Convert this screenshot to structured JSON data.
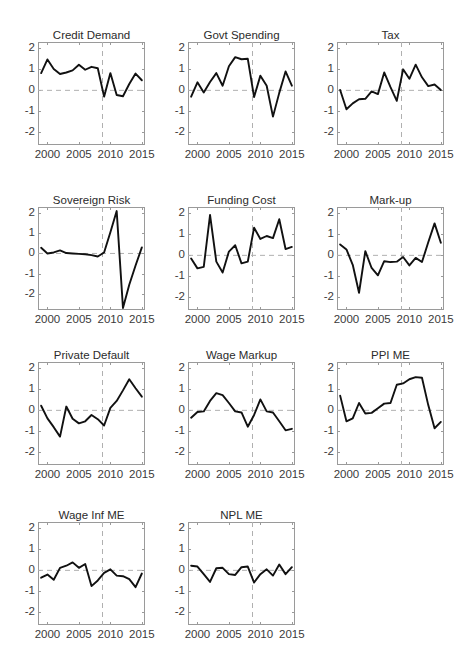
{
  "figure": {
    "panel_cols": 3,
    "panel_rows": 4,
    "axis_color": "#9a9a9a",
    "line_color": "#111111",
    "grid_color": "#b0b0b0"
  },
  "chart_data": [
    {
      "type": "line",
      "title": "Credit Demand",
      "xlabel": "",
      "ylabel": "",
      "xlim": [
        1998.5,
        2015.5
      ],
      "ylim": [
        -2.6,
        2.3
      ],
      "xticks": [
        2000,
        2005,
        2010,
        2015
      ],
      "yticks": [
        2,
        1,
        0,
        -1,
        -2
      ],
      "grid": false,
      "zero_line": true,
      "vline": 2008.75,
      "x": [
        1999,
        2000,
        2001,
        2002,
        2003,
        2004,
        2005,
        2006,
        2007,
        2008,
        2009,
        2010,
        2011,
        2012,
        2013,
        2014,
        2015
      ],
      "values": [
        0.82,
        1.47,
        1.02,
        0.78,
        0.85,
        0.95,
        1.22,
        0.98,
        1.12,
        1.05,
        -0.3,
        0.82,
        -0.22,
        -0.28,
        0.3,
        0.8,
        0.48
      ]
    },
    {
      "type": "line",
      "title": "Govt Spending",
      "xlabel": "",
      "ylabel": "",
      "xlim": [
        1998.5,
        2015.5
      ],
      "ylim": [
        -2.6,
        2.3
      ],
      "xticks": [
        2000,
        2005,
        2010,
        2015
      ],
      "yticks": [
        2,
        1,
        0,
        -1,
        -2
      ],
      "grid": false,
      "zero_line": true,
      "vline": 2008.75,
      "x": [
        1999,
        2000,
        2001,
        2002,
        2003,
        2004,
        2005,
        2006,
        2007,
        2008,
        2009,
        2010,
        2011,
        2012,
        2013,
        2014,
        2015
      ],
      "values": [
        -0.3,
        0.38,
        -0.1,
        0.4,
        0.82,
        0.22,
        1.15,
        1.58,
        1.48,
        1.5,
        -0.32,
        0.7,
        0.22,
        -1.25,
        -0.12,
        0.9,
        0.22
      ]
    },
    {
      "type": "line",
      "title": "Tax",
      "xlabel": "",
      "ylabel": "",
      "xlim": [
        1998.5,
        2015.5
      ],
      "ylim": [
        -2.6,
        2.3
      ],
      "xticks": [
        2000,
        2005,
        2010,
        2015
      ],
      "yticks": [
        2,
        1,
        0,
        -1,
        -2
      ],
      "grid": false,
      "zero_line": true,
      "vline": 2008.75,
      "x": [
        1999,
        2000,
        2001,
        2002,
        2003,
        2004,
        2005,
        2006,
        2007,
        2008,
        2009,
        2010,
        2011,
        2012,
        2013,
        2014,
        2015
      ],
      "values": [
        0.02,
        -0.9,
        -0.62,
        -0.42,
        -0.4,
        -0.05,
        -0.18,
        0.85,
        0.15,
        -0.5,
        1.0,
        0.55,
        1.22,
        0.62,
        0.2,
        0.28,
        0.02
      ]
    },
    {
      "type": "line",
      "title": "Sovereign Risk",
      "xlabel": "",
      "ylabel": "",
      "xlim": [
        1998.5,
        2015.5
      ],
      "ylim": [
        -2.8,
        2.3
      ],
      "xticks": [
        2000,
        2005,
        2010,
        2015
      ],
      "yticks": [
        2,
        1,
        0,
        -1,
        -2
      ],
      "grid": false,
      "zero_line": true,
      "vline": 2008.75,
      "x": [
        1999,
        2000,
        2001,
        2002,
        2003,
        2004,
        2005,
        2006,
        2007,
        2008,
        2009,
        2010,
        2011,
        2012,
        2013,
        2014,
        2015
      ],
      "values": [
        0.28,
        0.0,
        0.05,
        0.15,
        0.02,
        0.0,
        -0.02,
        -0.04,
        -0.08,
        -0.15,
        0.05,
        1.05,
        2.1,
        -2.7,
        -1.55,
        -0.6,
        0.3
      ]
    },
    {
      "type": "line",
      "title": "Funding Cost",
      "xlabel": "",
      "ylabel": "",
      "xlim": [
        1998.5,
        2015.5
      ],
      "ylim": [
        -2.6,
        2.3
      ],
      "xticks": [
        2000,
        2005,
        2010,
        2015
      ],
      "yticks": [
        2,
        1,
        0,
        -1,
        -2
      ],
      "grid": false,
      "zero_line": true,
      "vline": 2008.75,
      "x": [
        1999,
        2000,
        2001,
        2002,
        2003,
        2004,
        2005,
        2006,
        2007,
        2008,
        2009,
        2010,
        2011,
        2012,
        2013,
        2014,
        2015
      ],
      "values": [
        -0.15,
        -0.62,
        -0.55,
        1.92,
        -0.3,
        -0.82,
        0.18,
        0.48,
        -0.38,
        -0.3,
        1.32,
        0.78,
        0.92,
        0.82,
        1.72,
        0.3,
        0.4
      ]
    },
    {
      "type": "line",
      "title": "Mark-up",
      "xlabel": "",
      "ylabel": "",
      "xlim": [
        1998.5,
        2015.5
      ],
      "ylim": [
        -2.6,
        2.3
      ],
      "xticks": [
        2000,
        2005,
        2010,
        2015
      ],
      "yticks": [
        2,
        1,
        0,
        -1,
        -2
      ],
      "grid": false,
      "zero_line": true,
      "vline": 2008.75,
      "x": [
        1999,
        2000,
        2001,
        2002,
        2003,
        2004,
        2005,
        2006,
        2007,
        2008,
        2009,
        2010,
        2011,
        2012,
        2013,
        2014,
        2015
      ],
      "values": [
        0.52,
        0.28,
        -0.45,
        -1.78,
        0.2,
        -0.6,
        -0.95,
        -0.28,
        -0.32,
        -0.3,
        -0.08,
        -0.48,
        -0.12,
        -0.32,
        0.62,
        1.52,
        0.6
      ]
    },
    {
      "type": "line",
      "title": "Private Default",
      "xlabel": "",
      "ylabel": "",
      "xlim": [
        1998.5,
        2015.5
      ],
      "ylim": [
        -2.6,
        2.3
      ],
      "xticks": [
        2000,
        2005,
        2010,
        2015
      ],
      "yticks": [
        2,
        1,
        0,
        -1,
        -2
      ],
      "grid": false,
      "zero_line": true,
      "vline": 2008.75,
      "x": [
        1999,
        2000,
        2001,
        2002,
        2003,
        2004,
        2005,
        2006,
        2007,
        2008,
        2009,
        2010,
        2011,
        2012,
        2013,
        2014,
        2015
      ],
      "values": [
        0.22,
        -0.38,
        -0.8,
        -1.25,
        0.18,
        -0.4,
        -0.62,
        -0.52,
        -0.22,
        -0.42,
        -0.72,
        0.12,
        0.45,
        0.95,
        1.48,
        1.05,
        0.65
      ]
    },
    {
      "type": "line",
      "title": "Wage Markup",
      "xlabel": "",
      "ylabel": "",
      "xlim": [
        1998.5,
        2015.5
      ],
      "ylim": [
        -2.6,
        2.3
      ],
      "xticks": [
        2000,
        2005,
        2010,
        2015
      ],
      "yticks": [
        2,
        1,
        0,
        -1,
        -2
      ],
      "grid": false,
      "zero_line": true,
      "vline": 2008.75,
      "x": [
        1999,
        2000,
        2001,
        2002,
        2003,
        2004,
        2005,
        2006,
        2007,
        2008,
        2009,
        2010,
        2011,
        2012,
        2013,
        2014,
        2015
      ],
      "values": [
        -0.35,
        -0.08,
        -0.05,
        0.45,
        0.82,
        0.72,
        0.35,
        -0.05,
        -0.1,
        -0.78,
        -0.22,
        0.52,
        -0.05,
        -0.1,
        -0.52,
        -0.95,
        -0.88,
        0.02
      ]
    },
    {
      "type": "line",
      "title": "PPI ME",
      "xlabel": "",
      "ylabel": "",
      "xlim": [
        1998.5,
        2015.5
      ],
      "ylim": [
        -2.6,
        2.3
      ],
      "xticks": [
        2000,
        2005,
        2010,
        2015
      ],
      "yticks": [
        2,
        1,
        0,
        -1,
        -2
      ],
      "grid": false,
      "zero_line": true,
      "vline": 2008.75,
      "x": [
        1999,
        2000,
        2001,
        2002,
        2003,
        2004,
        2005,
        2006,
        2007,
        2008,
        2009,
        2010,
        2011,
        2012,
        2013,
        2014,
        2015
      ],
      "values": [
        0.7,
        -0.52,
        -0.38,
        0.35,
        -0.15,
        -0.12,
        0.1,
        0.32,
        0.35,
        1.22,
        1.28,
        1.48,
        1.58,
        1.55,
        0.25,
        -0.85,
        -0.55
      ]
    },
    {
      "type": "line",
      "title": "Wage Inf ME",
      "xlabel": "",
      "ylabel": "",
      "xlim": [
        1998.5,
        2015.5
      ],
      "ylim": [
        -2.6,
        2.3
      ],
      "xticks": [
        2000,
        2005,
        2010,
        2015
      ],
      "yticks": [
        2,
        1,
        0,
        -1,
        -2
      ],
      "grid": false,
      "zero_line": true,
      "vline": 2008.75,
      "x": [
        1999,
        2000,
        2001,
        2002,
        2003,
        2004,
        2005,
        2006,
        2007,
        2008,
        2009,
        2010,
        2011,
        2012,
        2013,
        2014,
        2015
      ],
      "values": [
        -0.35,
        -0.2,
        -0.45,
        0.12,
        0.22,
        0.38,
        0.12,
        0.3,
        -0.75,
        -0.48,
        -0.12,
        0.05,
        -0.25,
        -0.28,
        -0.42,
        -0.8,
        -0.15
      ]
    },
    {
      "type": "line",
      "title": "NPL ME",
      "xlabel": "",
      "ylabel": "",
      "xlim": [
        1998.5,
        2015.5
      ],
      "ylim": [
        -2.6,
        2.3
      ],
      "xticks": [
        2000,
        2005,
        2010,
        2015
      ],
      "yticks": [
        2,
        1,
        0,
        -1,
        -2
      ],
      "grid": false,
      "zero_line": true,
      "vline": 2008.75,
      "x": [
        1999,
        2000,
        2001,
        2002,
        2003,
        2004,
        2005,
        2006,
        2007,
        2008,
        2009,
        2010,
        2011,
        2012,
        2013,
        2014,
        2015
      ],
      "values": [
        0.22,
        0.18,
        -0.18,
        -0.55,
        0.1,
        0.12,
        -0.18,
        -0.22,
        0.15,
        0.18,
        -0.58,
        -0.18,
        0.05,
        -0.25,
        0.28,
        -0.18,
        0.15
      ]
    }
  ]
}
